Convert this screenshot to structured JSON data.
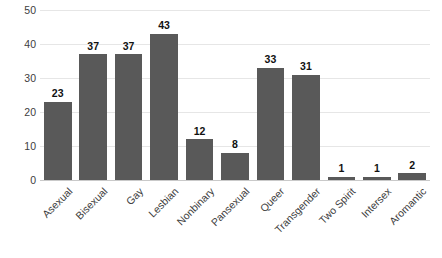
{
  "chart_data": {
    "type": "bar",
    "title": "",
    "subtitle": "",
    "xlabel": "",
    "ylabel": "",
    "categories": [
      "Asexual",
      "Bisexual",
      "Gay",
      "Lesbian",
      "Nonbinary",
      "Pansexual",
      "Queer",
      "Transgender",
      "Two Spirit",
      "Intersex",
      "Aromantic"
    ],
    "values": [
      23,
      37,
      37,
      43,
      12,
      8,
      33,
      31,
      1,
      1,
      2
    ],
    "data_labels": [
      "23",
      "37",
      "37",
      "43",
      "12",
      "8",
      "33",
      "31",
      "1",
      "1",
      "2"
    ],
    "ylim": [
      0,
      50
    ],
    "ytick_values": [
      0,
      10,
      20,
      30,
      40,
      50
    ],
    "ytick_labels": [
      "0",
      "10",
      "20",
      "30",
      "40",
      "50"
    ],
    "grid": "horizontal",
    "legend": "none",
    "bar_color": "#595959",
    "gridline_color": "#E6E6E6",
    "axis_color": "#C9C9C9",
    "label_color": "#404040",
    "value_label_color": "#111111",
    "background_color": "#FFFFFF",
    "xtick_rotation": -45
  }
}
